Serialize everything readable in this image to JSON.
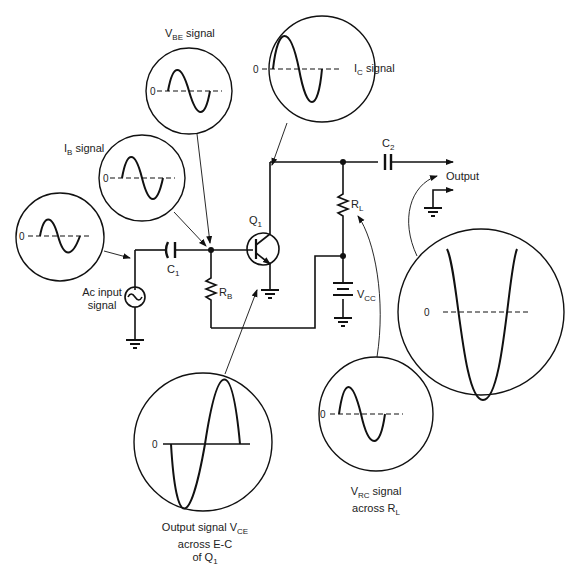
{
  "diagram": {
    "components": {
      "transistor": {
        "label": "Q",
        "sub": "1"
      },
      "input_capacitor": {
        "label": "C",
        "sub": "1"
      },
      "output_capacitor": {
        "label": "C",
        "sub": "2"
      },
      "base_resistor": {
        "label": "R",
        "sub": "B"
      },
      "load_resistor": {
        "label": "R",
        "sub": "L"
      },
      "supply": {
        "label": "V",
        "sub": "CC"
      },
      "source": {
        "label_line1": "Ac input",
        "label_line2": "signal"
      },
      "output": {
        "label": "Output"
      }
    },
    "scopes": [
      {
        "id": "ac-input",
        "label": "",
        "zero": "0"
      },
      {
        "id": "ib",
        "label_main": "I",
        "label_sub": "B",
        "label_rest": " signal",
        "zero": "0"
      },
      {
        "id": "vbe",
        "label_main": "V",
        "label_sub": "BE",
        "label_rest": " signal",
        "zero": "0"
      },
      {
        "id": "ic",
        "label_main": "I",
        "label_sub": "C",
        "label_rest": " signal",
        "zero": "0"
      },
      {
        "id": "vce",
        "line1_main": "Output signal V",
        "line1_sub": "CE",
        "line2": "across E-C",
        "line3_main": "of Q",
        "line3_sub": "1",
        "zero": "0"
      },
      {
        "id": "vrc",
        "line1_main": "V",
        "line1_sub": "RC",
        "line1_rest": " signal",
        "line2_main": "across R",
        "line2_sub": "L",
        "zero": "0"
      },
      {
        "id": "output",
        "label": "",
        "zero": "0"
      }
    ]
  }
}
